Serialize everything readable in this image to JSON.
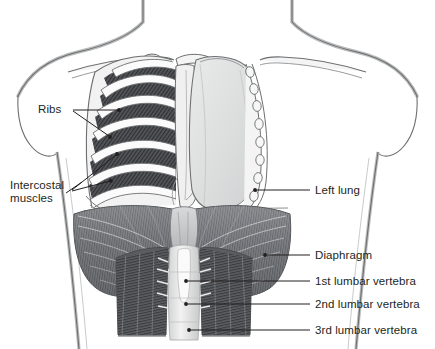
{
  "figure": {
    "background_color": "#ffffff",
    "ink_color": "#231f20"
  },
  "labels": {
    "ribs": "Ribs",
    "intercostal_line1": "Intercostal",
    "intercostal_line2": "muscles",
    "left_lung": "Left lung",
    "diaphragm": "Diaphragm",
    "lumbar_1": "1st lumbar vertebra",
    "lumbar_2": "2nd lumbar vertebra",
    "lumbar_3": "3rd lumbar vertebra"
  },
  "structures": {
    "body_outline": "torso-outline",
    "clavicle": "clavicle",
    "ribcage": "rib-cage-left-side",
    "intercostal_muscles": "intercostal-muscle-hatching",
    "lung": "left-lung",
    "rib_cross_sections": "cut-rib-ends",
    "mediastinum": "mediastinum",
    "diaphragm_dome": "diaphragm-dome",
    "diaphragm_crura": "diaphragm-crura",
    "vertebral_column": "lumbar-vertebral-column"
  },
  "colors": {
    "outline": "#6c6e70",
    "dark_muscle": "#58585a",
    "mid_muscle": "#8a8c8e",
    "light_tissue": "#e2e3e4",
    "lung_fill": "#dcdddd",
    "bone_white": "#f7f7f7",
    "leader_line": "#231f20"
  }
}
